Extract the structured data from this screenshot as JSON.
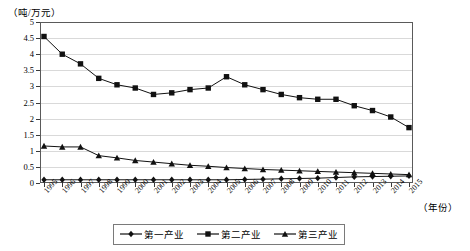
{
  "chart_data": {
    "type": "line",
    "title": "",
    "xlabel": "（年份）",
    "ylabel": "（吨/万元）",
    "ylim": [
      0,
      5
    ],
    "ytick_step": 0.5,
    "yticks": [
      "0",
      "0.5",
      "1",
      "1.5",
      "2",
      "2.5",
      "3",
      "3.5",
      "4",
      "4.5",
      "5"
    ],
    "grid": true,
    "legend_position": "bottom-center",
    "categories": [
      "1995",
      "1996",
      "1997",
      "1998",
      "1999",
      "2000",
      "2001",
      "2002",
      "2003",
      "2004",
      "2005",
      "2006",
      "2007",
      "2008",
      "2009",
      "2010",
      "2011",
      "2012",
      "2013",
      "2014",
      "2015"
    ],
    "series": [
      {
        "name": "第一产业",
        "marker": "diamond",
        "values": [
          0.1,
          0.1,
          0.1,
          0.1,
          0.1,
          0.1,
          0.1,
          0.1,
          0.1,
          0.1,
          0.1,
          0.11,
          0.12,
          0.13,
          0.14,
          0.15,
          0.17,
          0.19,
          0.2,
          0.21,
          0.22
        ]
      },
      {
        "name": "第二产业",
        "marker": "square",
        "values": [
          4.55,
          4.0,
          3.7,
          3.25,
          3.05,
          2.95,
          2.75,
          2.8,
          2.9,
          2.95,
          3.3,
          3.05,
          2.9,
          2.75,
          2.65,
          2.6,
          2.6,
          2.4,
          2.25,
          2.05,
          1.72
        ]
      },
      {
        "name": "第三产业",
        "marker": "triangle",
        "values": [
          1.15,
          1.12,
          1.12,
          0.85,
          0.78,
          0.7,
          0.65,
          0.6,
          0.55,
          0.52,
          0.48,
          0.45,
          0.42,
          0.4,
          0.38,
          0.36,
          0.34,
          0.32,
          0.3,
          0.28,
          0.26
        ]
      }
    ]
  },
  "legend": {
    "items": [
      {
        "label": "第一产业"
      },
      {
        "label": "第二产业"
      },
      {
        "label": "第三产业"
      }
    ]
  },
  "axes": {
    "y_axis_title": "（吨/万元）",
    "x_axis_title": "（年份）"
  }
}
